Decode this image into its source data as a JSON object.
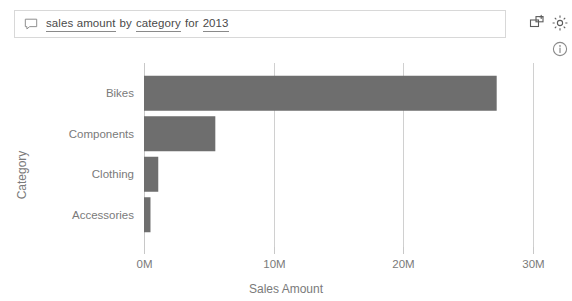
{
  "qna": {
    "icon": "speech-bubble-icon",
    "tokens": [
      {
        "text": "sales amount",
        "underlined": true
      },
      {
        "text": "by",
        "underlined": false
      },
      {
        "text": "category",
        "underlined": true
      },
      {
        "text": "for",
        "underlined": false
      },
      {
        "text": "2013",
        "underlined": true
      }
    ],
    "full_text": "sales amount by category for 2013",
    "placeholder": "Ask a question about your data"
  },
  "toolbar": {
    "pin_icon": "pin-to-report-icon",
    "gear_icon": "gear-icon",
    "info_icon": "info-circle-icon"
  },
  "colors": {
    "bar": "#6e6e6e",
    "grid": "#d0d0d0",
    "axis": "#c8c8c8",
    "label": "#7a7a7a",
    "query_text": "#4a4a4a",
    "query_border": "#d8d8d8"
  },
  "chart_data": {
    "type": "bar",
    "orientation": "horizontal",
    "title": "",
    "xlabel": "Sales Amount",
    "ylabel": "Category",
    "categories": [
      "Bikes",
      "Components",
      "Clothing",
      "Accessories"
    ],
    "values": [
      27.2,
      5.5,
      1.1,
      0.5
    ],
    "value_unit": "M",
    "xlim": [
      0,
      30
    ],
    "xticks": [
      0,
      10,
      20,
      30
    ],
    "xtick_labels": [
      "0M",
      "10M",
      "20M",
      "30M"
    ],
    "grid": true,
    "grid_axis": "x",
    "legend": false,
    "series": [
      {
        "name": "Sales Amount",
        "values": [
          27.2,
          5.5,
          1.1,
          0.5
        ]
      }
    ]
  }
}
